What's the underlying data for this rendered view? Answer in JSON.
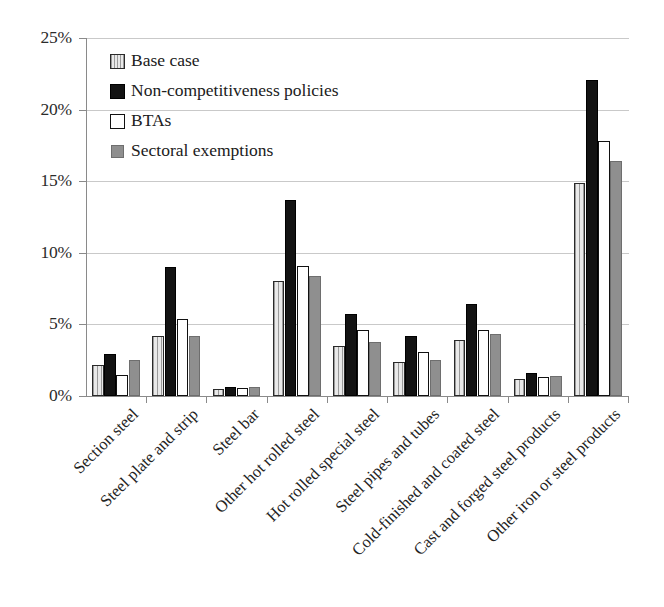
{
  "chart_data": {
    "type": "bar",
    "title": "",
    "subtitle": "",
    "xlabel": "",
    "ylabel": "",
    "ylim": [
      0,
      25
    ],
    "y_tick_labels": [
      "0%",
      "5%",
      "10%",
      "15%",
      "20%",
      "25%"
    ],
    "y_ticks": [
      0,
      5,
      10,
      15,
      20,
      25
    ],
    "grid": true,
    "legend_position": "top-left-inside",
    "categories": [
      "Section steel",
      "Steel plate and strip",
      "Steel bar",
      "Other hot rolled steel",
      "Hot rolled special steel",
      "Steel pipes and tubes",
      "Cold-finished and coated steel",
      "Cast and forged steel products",
      "Other iron or steel products"
    ],
    "series": [
      {
        "name": "Base case",
        "key": "base",
        "color": "#e9e9e9",
        "pattern": "vertical-hatch",
        "values": [
          2.2,
          4.2,
          0.5,
          8.0,
          3.5,
          2.4,
          3.9,
          1.2,
          14.9
        ]
      },
      {
        "name": "Non-competitiveness policies",
        "key": "noncomp",
        "color": "#131313",
        "pattern": "solid",
        "values": [
          2.9,
          9.0,
          0.6,
          13.7,
          5.7,
          4.2,
          6.4,
          1.6,
          22.1
        ]
      },
      {
        "name": "BTAs",
        "key": "btas",
        "color": "#ffffff",
        "pattern": "outline",
        "values": [
          1.5,
          5.4,
          0.55,
          9.1,
          4.6,
          3.1,
          4.6,
          1.3,
          17.8
        ]
      },
      {
        "name": "Sectoral exemptions",
        "key": "sectoral",
        "color": "#8f8f8f",
        "pattern": "solid",
        "values": [
          2.5,
          4.2,
          0.65,
          8.4,
          3.8,
          2.5,
          4.3,
          1.4,
          16.4
        ]
      }
    ]
  },
  "axes": {
    "axis_line_color": "#8a8a8a",
    "gridline_color": "#c9c9c9"
  }
}
